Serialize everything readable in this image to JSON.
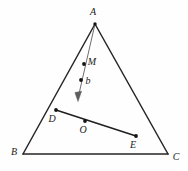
{
  "figure": {
    "background_color": "#fefefe",
    "stroke_color": "#262626",
    "vector_color": "#6e6e6e",
    "dot_color": "#141414",
    "width": 188,
    "height": 171,
    "vertices": [
      {
        "id": "A",
        "label": "A",
        "x": 95,
        "y": 24,
        "label_x": 93,
        "label_y": 13
      },
      {
        "id": "B",
        "label": "B",
        "x": 23,
        "y": 154,
        "label_x": 14,
        "label_y": 153
      },
      {
        "id": "C",
        "label": "C",
        "x": 168,
        "y": 154,
        "label_x": 176,
        "label_y": 158
      }
    ],
    "points": [
      {
        "id": "M",
        "label": "M",
        "x": 84,
        "y": 64,
        "label_x": 92,
        "label_y": 63,
        "dot": true
      },
      {
        "id": "b",
        "label": "b",
        "x": 81,
        "y": 80,
        "label_x": 88,
        "label_y": 82,
        "dot": true
      },
      {
        "id": "D",
        "label": "D",
        "x": 56,
        "y": 110,
        "label_x": 52,
        "label_y": 120,
        "dot": true
      },
      {
        "id": "O",
        "label": "O",
        "x": 85,
        "y": 121,
        "label_x": 83,
        "label_y": 131,
        "dot": true
      },
      {
        "id": "E",
        "label": "E",
        "x": 136,
        "y": 136,
        "label_x": 133,
        "label_y": 146,
        "dot": true
      }
    ],
    "edges": [
      {
        "id": "AB",
        "from": "A",
        "to": "B"
      },
      {
        "id": "BC",
        "from": "B",
        "to": "C"
      },
      {
        "id": "CA",
        "from": "C",
        "to": "A"
      }
    ],
    "segments": [
      {
        "id": "DE",
        "x1": 56,
        "y1": 110,
        "x2": 136,
        "y2": 136
      }
    ],
    "vector": {
      "id": "vector-b",
      "from_x": 95,
      "from_y": 24,
      "to_x": 78,
      "to_y": 101,
      "head_points": "74.9,93.2 81.2,92.0 78,101"
    }
  }
}
